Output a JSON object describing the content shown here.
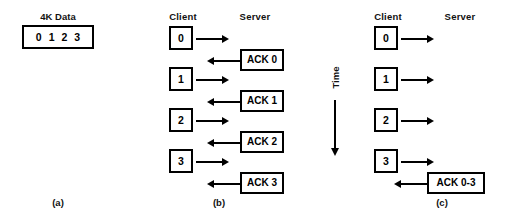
{
  "figure": {
    "background_color": "#ffffff",
    "ink_color": "#000000",
    "panels": [
      {
        "id": "a",
        "label": "(a)",
        "data_label": "4K Data",
        "segments": [
          "0",
          "1",
          "2",
          "3"
        ]
      },
      {
        "id": "b",
        "label": "(b)",
        "headers": {
          "client": "Client",
          "server": "Server"
        },
        "messages": [
          {
            "kind": "data",
            "direction": "right",
            "label": "0"
          },
          {
            "kind": "ack",
            "direction": "left",
            "label": "ACK 0"
          },
          {
            "kind": "data",
            "direction": "right",
            "label": "1"
          },
          {
            "kind": "ack",
            "direction": "left",
            "label": "ACK 1"
          },
          {
            "kind": "data",
            "direction": "right",
            "label": "2"
          },
          {
            "kind": "ack",
            "direction": "left",
            "label": "ACK 2"
          },
          {
            "kind": "data",
            "direction": "right",
            "label": "3"
          },
          {
            "kind": "ack",
            "direction": "left",
            "label": "ACK 3"
          }
        ]
      },
      {
        "id": "c",
        "label": "(c)",
        "headers": {
          "client": "Client",
          "server": "Server"
        },
        "messages": [
          {
            "kind": "data",
            "direction": "right",
            "label": "0"
          },
          {
            "kind": "data",
            "direction": "right",
            "label": "1"
          },
          {
            "kind": "data",
            "direction": "right",
            "label": "2"
          },
          {
            "kind": "data",
            "direction": "right",
            "label": "3"
          },
          {
            "kind": "ack",
            "direction": "left",
            "label": "ACK 0-3"
          }
        ]
      }
    ],
    "time_axis": {
      "label": "Time",
      "direction": "downward"
    }
  }
}
